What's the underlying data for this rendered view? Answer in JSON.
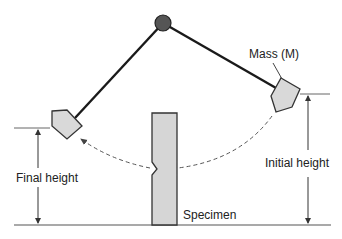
{
  "diagram": {
    "labels": {
      "mass": "Mass (M)",
      "initial_height": "Initial height",
      "final_height": "Final height",
      "specimen": "Specimen"
    },
    "colors": {
      "pivot": "#555555",
      "arm": "#1a1a1a",
      "mass_fill": "#d9d9d9",
      "specimen_fill": "#d6d6d6",
      "line": "#333333",
      "dashed_path": "#555555"
    },
    "elements": [
      {
        "id": "pivot",
        "type": "circle"
      },
      {
        "id": "pendulum-arm-left",
        "type": "line",
        "description": "pendulum at final position"
      },
      {
        "id": "pendulum-arm-right",
        "type": "line",
        "description": "pendulum at initial position"
      },
      {
        "id": "mass-left",
        "type": "pentagon"
      },
      {
        "id": "mass-right",
        "type": "pentagon"
      },
      {
        "id": "specimen",
        "type": "notched-bar"
      },
      {
        "id": "swing-path",
        "type": "dashed-arc-arrow",
        "from": "mass-right",
        "to": "mass-left"
      },
      {
        "id": "initial-height-dimension",
        "type": "double-arrow"
      },
      {
        "id": "final-height-dimension",
        "type": "double-arrow"
      },
      {
        "id": "ground-line",
        "type": "line"
      }
    ]
  }
}
